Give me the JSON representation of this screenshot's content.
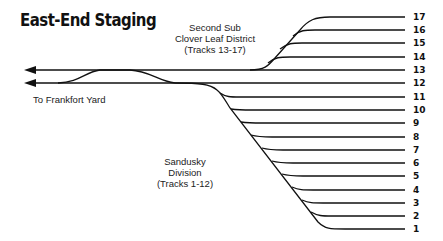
{
  "title": "East-End Staging",
  "labels": {
    "second_sub_line1": "Second Sub",
    "second_sub_line2": "Clover Leaf District",
    "second_sub_line3": "(Tracks 13-17)",
    "frankfort": "To Frankfort Yard",
    "sandusky_line1": "Sandusky",
    "sandusky_line2": "Division",
    "sandusky_line3": "(Tracks 1-12)"
  },
  "tracks": [
    "17",
    "16",
    "15",
    "14",
    "13",
    "12",
    "11",
    "10",
    "9",
    "8",
    "7",
    "6",
    "5",
    "4",
    "3",
    "2",
    "1"
  ],
  "colors": {
    "line": "#111111",
    "background": "#ffffff"
  }
}
